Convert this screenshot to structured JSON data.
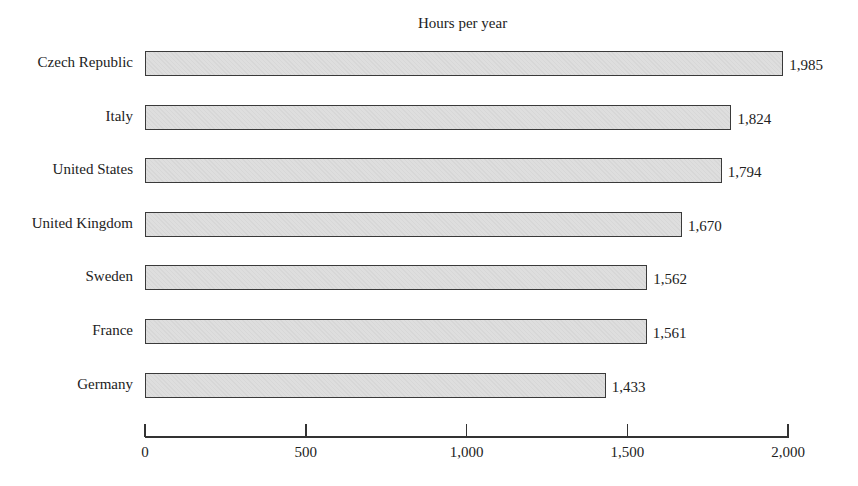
{
  "chart_data": {
    "type": "bar",
    "orientation": "horizontal",
    "title": "Hours per year",
    "xlabel": "",
    "ylabel": "",
    "categories": [
      "Czech Republic",
      "Italy",
      "United States",
      "United Kingdom",
      "Sweden",
      "France",
      "Germany"
    ],
    "values": [
      1985,
      1824,
      1794,
      1670,
      1562,
      1561,
      1433
    ],
    "value_labels": [
      "1,985",
      "1,824",
      "1,794",
      "1,670",
      "1,562",
      "1,561",
      "1,433"
    ],
    "xlim": [
      0,
      2000
    ],
    "xticks": [
      0,
      500,
      1000,
      1500,
      2000
    ],
    "xtick_labels": [
      "0",
      "500",
      "1,000",
      "1,500",
      "2,000"
    ],
    "grid": false,
    "legend": null,
    "bar_color": "#dedede",
    "bar_edge_color": "#3a3a3a"
  }
}
